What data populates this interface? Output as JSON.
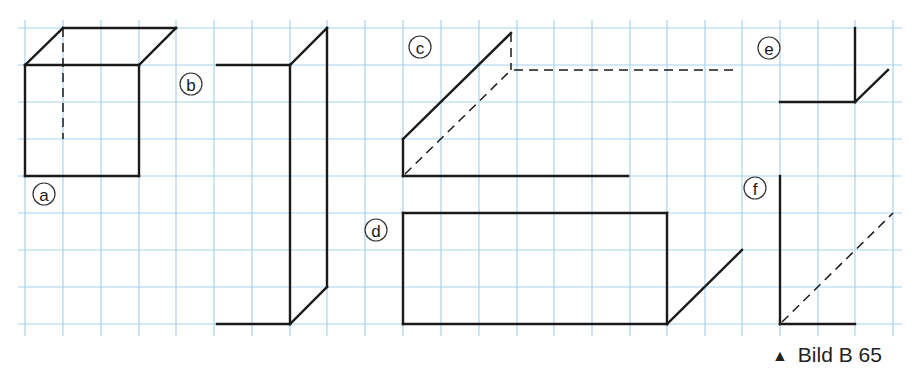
{
  "figure": {
    "caption_marker": "▲",
    "caption": "Bild B 65",
    "grid": {
      "x_lines": [
        25,
        63,
        101,
        139,
        176,
        214,
        252,
        290,
        327,
        365,
        403,
        441,
        479,
        517,
        554,
        592,
        630,
        667,
        705,
        742,
        780,
        818,
        855,
        893
      ],
      "y_lines": [
        28,
        65,
        102,
        139,
        176,
        213,
        250,
        287,
        324
      ],
      "color": "#a9d3ec"
    },
    "labels": [
      {
        "id": "a",
        "text": "a",
        "x": 44,
        "y": 194
      },
      {
        "id": "b",
        "text": "b",
        "x": 191,
        "y": 84
      },
      {
        "id": "c",
        "text": "c",
        "x": 420,
        "y": 47
      },
      {
        "id": "d",
        "text": "d",
        "x": 376,
        "y": 230
      },
      {
        "id": "e",
        "text": "e",
        "x": 769,
        "y": 48
      },
      {
        "id": "f",
        "text": "f",
        "x": 755,
        "y": 188
      }
    ],
    "shapes": {
      "a": {
        "solid": [
          [
            25,
            65,
            139,
            65
          ],
          [
            25,
            65,
            25,
            176
          ],
          [
            139,
            65,
            139,
            176
          ],
          [
            25,
            176,
            139,
            176
          ],
          [
            25,
            65,
            63,
            28
          ],
          [
            63,
            28,
            176,
            28
          ],
          [
            139,
            65,
            176,
            28
          ]
        ],
        "dashed": [
          [
            63,
            28,
            63,
            139
          ]
        ]
      },
      "b": {
        "solid": [
          [
            217,
            65,
            290,
            65
          ],
          [
            290,
            65,
            290,
            324
          ],
          [
            217,
            324,
            290,
            324
          ],
          [
            290,
            65,
            327,
            28
          ],
          [
            327,
            28,
            327,
            287
          ],
          [
            290,
            324,
            327,
            287
          ]
        ],
        "dashed": []
      },
      "c": {
        "solid": [
          [
            403,
            139,
            403,
            176
          ],
          [
            403,
            139,
            511,
            33
          ],
          [
            403,
            176,
            628,
            176
          ]
        ],
        "dashed": [
          [
            511,
            33,
            511,
            70
          ],
          [
            514,
            70,
            735,
            70
          ],
          [
            405,
            174,
            511,
            70
          ]
        ]
      },
      "d": {
        "solid": [
          [
            403,
            213,
            667,
            213
          ],
          [
            403,
            213,
            403,
            324
          ],
          [
            667,
            213,
            667,
            324
          ],
          [
            403,
            324,
            667,
            324
          ],
          [
            667,
            324,
            742,
            250
          ]
        ],
        "dashed": []
      },
      "e": {
        "solid": [
          [
            855,
            28,
            855,
            102
          ],
          [
            780,
            102,
            855,
            102
          ],
          [
            855,
            102,
            888,
            70
          ]
        ],
        "dashed": []
      },
      "f": {
        "solid": [
          [
            780,
            176,
            780,
            324
          ],
          [
            780,
            324,
            855,
            324
          ]
        ],
        "dashed": [
          [
            782,
            322,
            893,
            213
          ]
        ]
      }
    }
  }
}
